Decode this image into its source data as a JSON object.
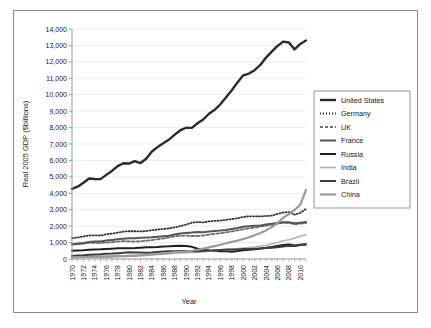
{
  "chart_data": {
    "type": "line",
    "title": "",
    "xlabel": "Year",
    "ylabel": "Real 2005 GDP ($billions)",
    "xlim": [
      1970,
      2011
    ],
    "ylim": [
      0,
      14000
    ],
    "ytick_step": 1000,
    "xtick_step": 2,
    "grid": "horizontal",
    "legend_position": "right",
    "ytick_labels": [
      "0",
      "1,000",
      "2,000",
      "3,000",
      "4,000",
      "5,000",
      "6,000",
      "7,000",
      "8,000",
      "9,000",
      "10,000",
      "11,000",
      "12,000",
      "13,000",
      "14,000"
    ],
    "xtick_labels": [
      "1970",
      "1972",
      "1974",
      "1976",
      "1978",
      "1980",
      "1982",
      "1984",
      "1986",
      "1988",
      "1990",
      "1992",
      "1994",
      "1996",
      "1998",
      "2000",
      "2002",
      "2004",
      "2006",
      "2008",
      "2010"
    ],
    "x": [
      1970,
      1971,
      1972,
      1973,
      1974,
      1975,
      1976,
      1977,
      1978,
      1979,
      1980,
      1981,
      1982,
      1983,
      1984,
      1985,
      1986,
      1987,
      1988,
      1989,
      1990,
      1991,
      1992,
      1993,
      1994,
      1995,
      1996,
      1997,
      1998,
      1999,
      2000,
      2001,
      2002,
      2003,
      2004,
      2005,
      2006,
      2007,
      2008,
      2009,
      2010,
      2011
    ],
    "series": [
      {
        "name": "United States",
        "color": "#2b2b2b",
        "width": 2.4,
        "dash": "none",
        "values": [
          4270,
          4400,
          4640,
          4900,
          4870,
          4860,
          5120,
          5360,
          5650,
          5830,
          5810,
          5960,
          5840,
          6100,
          6540,
          6810,
          7040,
          7270,
          7570,
          7840,
          7990,
          7980,
          8260,
          8490,
          8840,
          9080,
          9420,
          9840,
          10270,
          10750,
          11180,
          11290,
          11490,
          11810,
          12260,
          12620,
          12970,
          13230,
          13180,
          12760,
          13090,
          13300
        ]
      },
      {
        "name": "Germany",
        "color": "#333333",
        "width": 1.8,
        "dash": "1,2",
        "values": [
          1270,
          1310,
          1370,
          1430,
          1440,
          1430,
          1500,
          1550,
          1600,
          1670,
          1690,
          1690,
          1680,
          1700,
          1750,
          1790,
          1830,
          1860,
          1930,
          2000,
          2100,
          2210,
          2250,
          2230,
          2290,
          2320,
          2340,
          2380,
          2430,
          2480,
          2560,
          2600,
          2600,
          2590,
          2620,
          2640,
          2740,
          2830,
          2860,
          2700,
          2810,
          3050
        ]
      },
      {
        "name": "UK",
        "color": "#6e6e6e",
        "width": 1.8,
        "dash": "3,2",
        "values": [
          880,
          900,
          930,
          990,
          980,
          970,
          1000,
          1020,
          1060,
          1090,
          1070,
          1060,
          1080,
          1120,
          1150,
          1200,
          1250,
          1310,
          1380,
          1410,
          1420,
          1400,
          1400,
          1430,
          1490,
          1530,
          1570,
          1620,
          1680,
          1740,
          1810,
          1860,
          1910,
          1980,
          2030,
          2090,
          2150,
          2210,
          2200,
          2110,
          2150,
          2190
        ]
      },
      {
        "name": "France",
        "color": "#555555",
        "width": 2.0,
        "dash": "none",
        "values": [
          900,
          940,
          980,
          1030,
          1070,
          1070,
          1120,
          1160,
          1200,
          1240,
          1260,
          1270,
          1300,
          1310,
          1330,
          1360,
          1390,
          1420,
          1490,
          1550,
          1590,
          1610,
          1640,
          1630,
          1670,
          1710,
          1730,
          1770,
          1830,
          1890,
          1960,
          2000,
          2020,
          2040,
          2100,
          2140,
          2190,
          2240,
          2240,
          2170,
          2210,
          2250
        ]
      },
      {
        "name": "Russia",
        "color": "#1f1f1f",
        "width": 2.0,
        "dash": "none",
        "values": [
          500,
          520,
          530,
          560,
          580,
          590,
          610,
          630,
          650,
          650,
          660,
          670,
          690,
          710,
          720,
          730,
          760,
          770,
          790,
          800,
          790,
          740,
          630,
          580,
          505,
          485,
          465,
          470,
          445,
          480,
          530,
          560,
          590,
          640,
          690,
          735,
          790,
          850,
          890,
          820,
          865,
          905
        ]
      },
      {
        "name": "India",
        "color": "#b5b5b5",
        "width": 1.6,
        "dash": "none",
        "values": [
          160,
          162,
          160,
          170,
          172,
          185,
          188,
          205,
          215,
          200,
          215,
          230,
          238,
          255,
          265,
          280,
          295,
          310,
          350,
          370,
          390,
          395,
          415,
          440,
          470,
          500,
          540,
          560,
          595,
          640,
          670,
          700,
          730,
          790,
          840,
          920,
          1010,
          1110,
          1170,
          1270,
          1380,
          1470
        ]
      },
      {
        "name": "Brazil",
        "color": "#3d3d3d",
        "width": 2.0,
        "dash": "none",
        "values": [
          190,
          210,
          230,
          260,
          280,
          295,
          320,
          330,
          350,
          375,
          405,
          390,
          392,
          380,
          400,
          430,
          460,
          475,
          470,
          485,
          465,
          470,
          465,
          490,
          520,
          540,
          555,
          575,
          575,
          580,
          605,
          615,
          625,
          632,
          670,
          690,
          716,
          760,
          800,
          798,
          856,
          880
        ]
      },
      {
        "name": "China",
        "color": "#9a9a9a",
        "width": 2.2,
        "dash": "none",
        "values": [
          100,
          110,
          112,
          122,
          124,
          135,
          130,
          142,
          160,
          172,
          185,
          195,
          215,
          240,
          275,
          310,
          335,
          375,
          420,
          440,
          455,
          500,
          565,
          630,
          705,
          785,
          870,
          960,
          1040,
          1120,
          1220,
          1320,
          1440,
          1580,
          1740,
          1940,
          2190,
          2500,
          2740,
          2990,
          3300,
          4200
        ]
      }
    ]
  },
  "legend": {
    "items": [
      {
        "label": "United States"
      },
      {
        "label": "Germany"
      },
      {
        "label": "UK"
      },
      {
        "label": "France"
      },
      {
        "label": "Russia"
      },
      {
        "label": "India"
      },
      {
        "label": "Brazil"
      },
      {
        "label": "China"
      }
    ]
  }
}
